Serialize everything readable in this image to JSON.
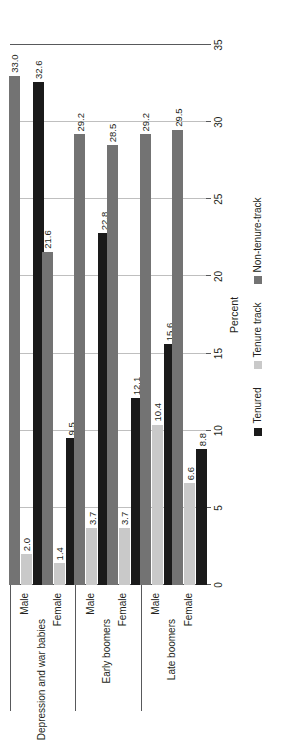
{
  "chart_data": {
    "type": "bar",
    "orientation": "horizontal-rotated",
    "title": "",
    "xlabel": "Percent",
    "ylabel": "",
    "ylim": [
      0,
      35
    ],
    "grid": true,
    "legend_position": "bottom",
    "tick_labels": [
      "0",
      "5",
      "10",
      "15",
      "20",
      "25",
      "30",
      "35"
    ],
    "tick_values": [
      0,
      5,
      10,
      15,
      20,
      25,
      30,
      35
    ],
    "groups": [
      {
        "name": "Depression and war babies",
        "categories": [
          "Male",
          "Female"
        ]
      },
      {
        "name": "Early boomers",
        "categories": [
          "Male",
          "Female"
        ]
      },
      {
        "name": "Late boomers",
        "categories": [
          "Male",
          "Female"
        ]
      }
    ],
    "categories": [
      "Depression and war babies - Male",
      "Depression and war babies - Female",
      "Early boomers - Male",
      "Early boomers - Female",
      "Late boomers - Male",
      "Late boomers - Female"
    ],
    "series": [
      {
        "name": "Tenured",
        "color": "#1a1a1a",
        "values": [
          32.6,
          9.5,
          22.8,
          12.1,
          15.6,
          8.8
        ],
        "labels": [
          "32.6",
          "9.5",
          "22.8",
          "12.1",
          "15.6",
          "8.8"
        ]
      },
      {
        "name": "Tenure track",
        "color": "#c9c9c9",
        "values": [
          2.0,
          1.4,
          3.7,
          3.7,
          10.4,
          6.6
        ],
        "labels": [
          "2.0",
          "1.4",
          "3.7",
          "3.7",
          "10.4",
          "6.6"
        ]
      },
      {
        "name": "Non-tenure-track",
        "color": "#737373",
        "values": [
          33.0,
          21.6,
          29.2,
          28.5,
          29.2,
          29.5
        ],
        "labels": [
          "33.0",
          "21.6",
          "29.2",
          "28.5",
          "29.2",
          "29.5"
        ]
      }
    ]
  },
  "axis": {
    "title": "Percent"
  },
  "legend": {
    "items": [
      {
        "label": "Tenured",
        "color": "#1a1a1a"
      },
      {
        "label": "Tenure track",
        "color": "#c9c9c9"
      },
      {
        "label": "Non-tenure-track",
        "color": "#737373"
      }
    ]
  }
}
